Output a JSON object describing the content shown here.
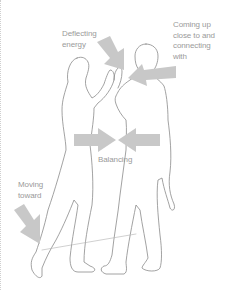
{
  "labels": {
    "deflecting": "Deflecting\nenergy",
    "coming_up": "Coming up\nclose to and\nconnecting\nwith",
    "balancing": "Balancing",
    "moving_toward": "Moving\ntoward"
  },
  "colors": {
    "arrow": "#c8c8c8",
    "outline": "#8a8a8a",
    "text": "#9a9a9a",
    "background": "#ffffff"
  }
}
